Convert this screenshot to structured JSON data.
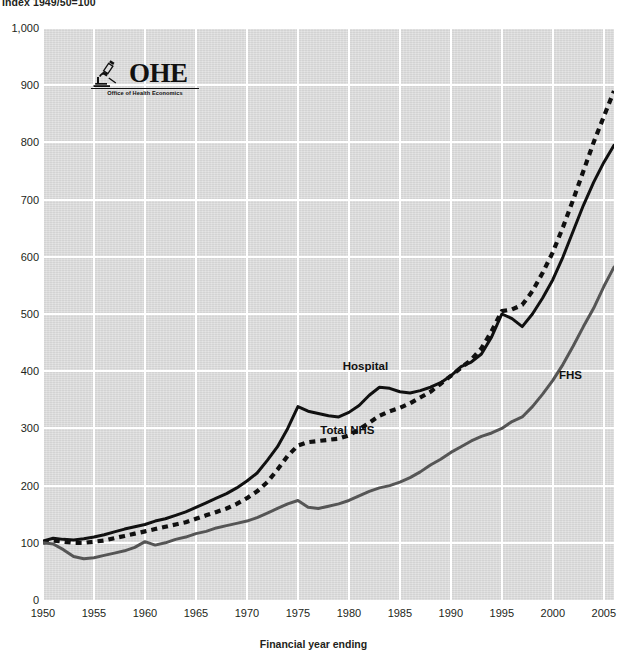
{
  "header": {
    "index_note": "Index 1949/50=100"
  },
  "logo": {
    "name": "OHE",
    "wordmark": "OHE",
    "tagline": "Office of Health Economics",
    "icon": "microscope-icon"
  },
  "axis_title": "Financial year ending",
  "colors": {
    "plot_background": "#dcdcdc",
    "gridline": "#ffffff",
    "hospital": "#101010",
    "total_nhs": "#101010",
    "fhs": "#555555",
    "text": "#231f20"
  },
  "chart_data": {
    "type": "line",
    "title": "",
    "subtitle": "Index 1949/50=100",
    "xlabel": "Financial year ending",
    "ylabel": "",
    "xlim": [
      1950,
      2006
    ],
    "ylim": [
      0,
      1000
    ],
    "ytick_labels": [
      "0",
      "100",
      "200",
      "300",
      "400",
      "500",
      "600",
      "700",
      "800",
      "900",
      "1,000"
    ],
    "yticks": [
      0,
      100,
      200,
      300,
      400,
      500,
      600,
      700,
      800,
      900,
      1000
    ],
    "xtick_labels": [
      "1950",
      "1955",
      "1960",
      "1965",
      "1970",
      "1975",
      "1980",
      "1985",
      "1990",
      "1995",
      "2000",
      "2005"
    ],
    "xticks": [
      1950,
      1955,
      1960,
      1965,
      1970,
      1975,
      1980,
      1985,
      1990,
      1995,
      2000,
      2005
    ],
    "grid": true,
    "legend": "in-plot labels",
    "x": [
      1950,
      1951,
      1952,
      1953,
      1954,
      1955,
      1956,
      1957,
      1958,
      1959,
      1960,
      1961,
      1962,
      1963,
      1964,
      1965,
      1966,
      1967,
      1968,
      1969,
      1970,
      1971,
      1972,
      1973,
      1974,
      1975,
      1976,
      1977,
      1978,
      1979,
      1980,
      1981,
      1982,
      1983,
      1984,
      1985,
      1986,
      1987,
      1988,
      1989,
      1990,
      1991,
      1992,
      1993,
      1994,
      1995,
      1996,
      1997,
      1998,
      1999,
      2000,
      2001,
      2002,
      2003,
      2004,
      2005,
      2006
    ],
    "series": [
      {
        "name": "Hospital",
        "style": "solid",
        "color": "#101010",
        "label_position": {
          "x": 1979.4,
          "y": 408
        },
        "values": [
          103,
          108,
          106,
          105,
          107,
          110,
          114,
          119,
          124,
          128,
          132,
          138,
          142,
          148,
          154,
          162,
          170,
          178,
          186,
          196,
          208,
          222,
          244,
          268,
          300,
          338,
          330,
          326,
          322,
          320,
          328,
          340,
          358,
          372,
          370,
          364,
          362,
          366,
          372,
          380,
          392,
          408,
          416,
          430,
          460,
          500,
          492,
          478,
          500,
          528,
          560,
          600,
          645,
          690,
          730,
          765,
          795
        ]
      },
      {
        "name": "Total NHS",
        "style": "dashed",
        "color": "#101010",
        "label_position": {
          "x": 1977.2,
          "y": 296
        },
        "values": [
          100,
          104,
          102,
          100,
          100,
          102,
          104,
          108,
          112,
          116,
          120,
          124,
          128,
          132,
          136,
          142,
          148,
          154,
          160,
          168,
          178,
          190,
          206,
          228,
          252,
          270,
          276,
          278,
          280,
          282,
          288,
          298,
          310,
          322,
          330,
          336,
          344,
          354,
          364,
          378,
          392,
          406,
          420,
          440,
          470,
          505,
          508,
          516,
          540,
          572,
          608,
          652,
          700,
          750,
          800,
          845,
          890
        ]
      },
      {
        "name": "FHS",
        "style": "solid",
        "color": "#555555",
        "label_position": {
          "x": 2000.6,
          "y": 392
        },
        "values": [
          100,
          98,
          88,
          76,
          72,
          74,
          78,
          82,
          86,
          92,
          102,
          96,
          100,
          106,
          110,
          116,
          120,
          126,
          130,
          134,
          138,
          144,
          152,
          160,
          168,
          174,
          162,
          160,
          164,
          168,
          174,
          182,
          190,
          196,
          200,
          206,
          214,
          224,
          236,
          246,
          258,
          268,
          278,
          286,
          292,
          300,
          312,
          320,
          338,
          360,
          384,
          412,
          444,
          478,
          510,
          548,
          582
        ]
      }
    ]
  }
}
